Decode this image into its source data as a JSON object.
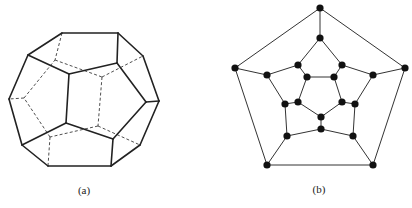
{
  "figure": {
    "panels": [
      {
        "id": "a",
        "caption": "(a)",
        "caption_pos": [
          84,
          184
        ],
        "description": "Dodecahedron wireframe with hidden edges dashed",
        "stroke_color": "#222222",
        "vertices": {
          "A": [
            62,
            33
          ],
          "B": [
            118,
            33
          ],
          "C": [
            143,
            56
          ],
          "D": [
            159,
            101
          ],
          "E": [
            140,
            145
          ],
          "F": [
            111,
            166
          ],
          "G": [
            48,
            166
          ],
          "H": [
            22,
            145
          ],
          "I": [
            9,
            99
          ],
          "J": [
            28,
            55
          ],
          "K": [
            69,
            74
          ],
          "L": [
            117,
            63
          ],
          "M": [
            146,
            102
          ],
          "N": [
            113,
            139
          ],
          "O": [
            66,
            123
          ],
          "P1": [
            55,
            60
          ],
          "P2": [
            24,
            98
          ],
          "P3": [
            50,
            137
          ],
          "Q1": [
            102,
            77
          ],
          "Q2": [
            98,
            126
          ]
        },
        "solid_edges": [
          [
            "A",
            "B"
          ],
          [
            "B",
            "C"
          ],
          [
            "C",
            "D"
          ],
          [
            "D",
            "E"
          ],
          [
            "E",
            "F"
          ],
          [
            "F",
            "G"
          ],
          [
            "G",
            "H"
          ],
          [
            "H",
            "I"
          ],
          [
            "I",
            "J"
          ],
          [
            "J",
            "A"
          ],
          [
            "J",
            "K"
          ],
          [
            "B",
            "L"
          ],
          [
            "M",
            "D"
          ],
          [
            "N",
            "F"
          ],
          [
            "O",
            "H"
          ],
          [
            "K",
            "L"
          ],
          [
            "L",
            "M"
          ],
          [
            "M",
            "N"
          ],
          [
            "N",
            "O"
          ],
          [
            "O",
            "K"
          ]
        ],
        "dashed_edges": [
          [
            "A",
            "P1"
          ],
          [
            "P1",
            "Q1"
          ],
          [
            "Q1",
            "C"
          ],
          [
            "Q1",
            "Q2"
          ],
          [
            "Q2",
            "E"
          ],
          [
            "Q2",
            "P3"
          ],
          [
            "P3",
            "G"
          ],
          [
            "P3",
            "P2"
          ],
          [
            "P2",
            "I"
          ],
          [
            "P2",
            "P1"
          ]
        ]
      },
      {
        "id": "b",
        "caption": "(b)",
        "caption_pos": [
          319,
          183
        ],
        "description": "Planar graph of the dodecahedron (Schlegel diagram)",
        "stroke_color": "#333333",
        "node_color": "#111111",
        "node_radius": 3.6,
        "vertices": {
          "o1": [
            320,
            8
          ],
          "o2": [
            405,
            68
          ],
          "o3": [
            373,
            165
          ],
          "o4": [
            267,
            165
          ],
          "o5": [
            235,
            68
          ],
          "m1": [
            320,
            38
          ],
          "m2": [
            342,
            65
          ],
          "m3": [
            373,
            75
          ],
          "m4": [
            355,
            104
          ],
          "m5": [
            353,
            136
          ],
          "m6": [
            321,
            129
          ],
          "m7": [
            287,
            136
          ],
          "m8": [
            285,
            104
          ],
          "m9": [
            267,
            75
          ],
          "m10": [
            298,
            65
          ],
          "i1": [
            307,
            77
          ],
          "i2": [
            334,
            77
          ],
          "i3": [
            342,
            102
          ],
          "i4": [
            321,
            117
          ],
          "i5": [
            298,
            102
          ]
        },
        "edges": [
          [
            "o1",
            "o2"
          ],
          [
            "o2",
            "o3"
          ],
          [
            "o3",
            "o4"
          ],
          [
            "o4",
            "o5"
          ],
          [
            "o5",
            "o1"
          ],
          [
            "o1",
            "m1"
          ],
          [
            "o2",
            "m3"
          ],
          [
            "o3",
            "m5"
          ],
          [
            "o4",
            "m7"
          ],
          [
            "o5",
            "m9"
          ],
          [
            "m1",
            "m2"
          ],
          [
            "m2",
            "m3"
          ],
          [
            "m3",
            "m4"
          ],
          [
            "m4",
            "m5"
          ],
          [
            "m5",
            "m6"
          ],
          [
            "m6",
            "m7"
          ],
          [
            "m7",
            "m8"
          ],
          [
            "m8",
            "m9"
          ],
          [
            "m9",
            "m10"
          ],
          [
            "m10",
            "m1"
          ],
          [
            "m10",
            "i1"
          ],
          [
            "m2",
            "i2"
          ],
          [
            "m4",
            "i3"
          ],
          [
            "m6",
            "i4"
          ],
          [
            "m8",
            "i5"
          ],
          [
            "i1",
            "i2"
          ],
          [
            "i2",
            "i3"
          ],
          [
            "i3",
            "i4"
          ],
          [
            "i4",
            "i5"
          ],
          [
            "i5",
            "i1"
          ]
        ]
      }
    ]
  }
}
